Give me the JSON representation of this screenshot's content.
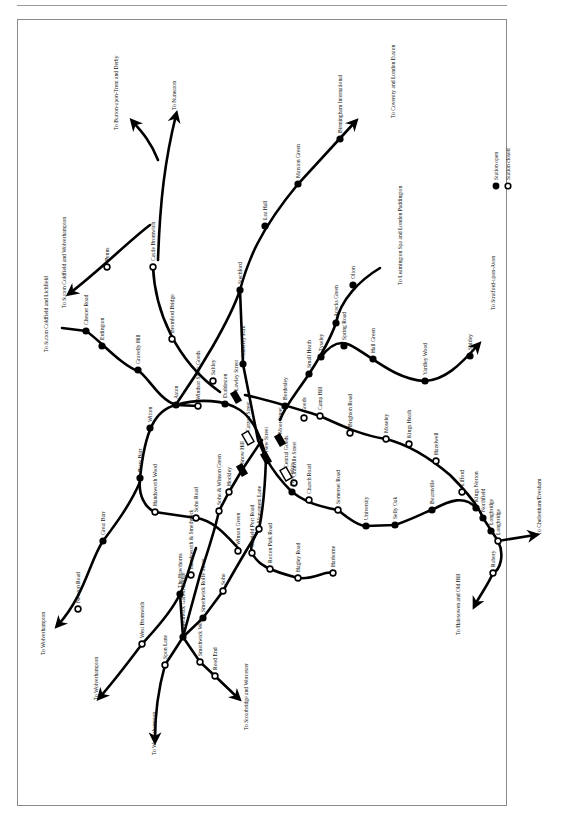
{
  "header": {
    "running_title": ""
  },
  "map": {
    "title": "Birmingham railway network",
    "orientation": "rotated 90° counter-clockwise",
    "legend": {
      "items": [
        {
          "label": "Station open",
          "symbol": "filled-circle"
        },
        {
          "label": "Station closed",
          "symbol": "open-circle"
        }
      ]
    },
    "destinations": [
      {
        "label": "To Nuneaton",
        "x": 176,
        "y": 110
      },
      {
        "label": "To Burton-upon-Trent and Derby",
        "x": 118,
        "y": 130
      },
      {
        "label": "To Sutton Coldfield and Wolverhampton",
        "x": 66,
        "y": 308
      },
      {
        "label": "To Sutton Coldfield and Lichfield",
        "x": 48,
        "y": 352
      },
      {
        "label": "To Coventry and London Euston",
        "x": 395,
        "y": 118
      },
      {
        "label": "To Leamington Spa and London Paddington",
        "x": 402,
        "y": 285
      },
      {
        "label": "To Stratford-upon-Avon",
        "x": 495,
        "y": 310
      },
      {
        "label": "To Cheltenham/Evesham",
        "x": 541,
        "y": 535
      },
      {
        "label": "To Halesowen and Old Hill",
        "x": 460,
        "y": 635
      },
      {
        "label": "To Wolverhampton",
        "x": 45,
        "y": 655
      },
      {
        "label": "To Wolverhampton",
        "x": 98,
        "y": 700
      },
      {
        "label": "To Wolverhampton",
        "x": 156,
        "y": 755
      },
      {
        "label": "To Stourbridge and Worcester",
        "x": 248,
        "y": 730
      }
    ],
    "stations": [
      {
        "name": "Penns",
        "status": "closed",
        "x": 107,
        "y": 267
      },
      {
        "name": "Castle Bromwich",
        "status": "closed",
        "x": 153,
        "y": 267
      },
      {
        "name": "Bromford Bridge",
        "status": "closed",
        "x": 172,
        "y": 339
      },
      {
        "name": "Saltley",
        "status": "closed",
        "x": 213,
        "y": 381
      },
      {
        "name": "Chester Road",
        "status": "open",
        "x": 86,
        "y": 331
      },
      {
        "name": "Erdington",
        "status": "open",
        "x": 102,
        "y": 346
      },
      {
        "name": "Gravelly Hill",
        "status": "open",
        "x": 138,
        "y": 370
      },
      {
        "name": "Aston",
        "status": "open",
        "x": 176,
        "y": 405
      },
      {
        "name": "Witton",
        "status": "open",
        "x": 150,
        "y": 428
      },
      {
        "name": "Windsor Street Goods",
        "status": "closed",
        "x": 198,
        "y": 406
      },
      {
        "name": "Duddeston",
        "status": "open",
        "x": 225,
        "y": 404
      },
      {
        "name": "Lawley Street",
        "status": "goods",
        "x": 236,
        "y": 397
      },
      {
        "name": "Stechford",
        "status": "open",
        "x": 240,
        "y": 290
      },
      {
        "name": "Lea Hall",
        "status": "open",
        "x": 265,
        "y": 226
      },
      {
        "name": "Marston Green",
        "status": "open",
        "x": 298,
        "y": 184
      },
      {
        "name": "Birmingham International",
        "status": "open",
        "x": 340,
        "y": 139
      },
      {
        "name": "Adderley Park",
        "status": "open",
        "x": 243,
        "y": 364
      },
      {
        "name": "Bordesley",
        "status": "open",
        "x": 285,
        "y": 406
      },
      {
        "name": "Small Heath",
        "status": "open",
        "x": 309,
        "y": 374
      },
      {
        "name": "Tyseley",
        "status": "open",
        "x": 321,
        "y": 357
      },
      {
        "name": "Acocks Green",
        "status": "open",
        "x": 336,
        "y": 323
      },
      {
        "name": "Olton",
        "status": "open",
        "x": 353,
        "y": 285
      },
      {
        "name": "Spring Road",
        "status": "open",
        "x": 344,
        "y": 346
      },
      {
        "name": "Hall Green",
        "status": "open",
        "x": 373,
        "y": 359
      },
      {
        "name": "Yardley Wood",
        "status": "open",
        "x": 425,
        "y": 381
      },
      {
        "name": "Shirley",
        "status": "open",
        "x": 470,
        "y": 356
      },
      {
        "name": "Moor Street",
        "status": "goods",
        "x": 280,
        "y": 440
      },
      {
        "name": "Goods",
        "status": "closed",
        "x": 304,
        "y": 418
      },
      {
        "name": "Camp Hill",
        "status": "closed",
        "x": 320,
        "y": 416
      },
      {
        "name": "Brighton Road",
        "status": "closed",
        "x": 350,
        "y": 433
      },
      {
        "name": "Moseley",
        "status": "closed",
        "x": 386,
        "y": 439
      },
      {
        "name": "Kings Heath",
        "status": "closed",
        "x": 409,
        "y": 444
      },
      {
        "name": "Hazelwell",
        "status": "closed",
        "x": 436,
        "y": 461
      },
      {
        "name": "Lifford",
        "status": "closed",
        "x": 462,
        "y": 492
      },
      {
        "name": "Carzon Street",
        "status": "goods-closed",
        "x": 248,
        "y": 438
      },
      {
        "name": "Snow Hill",
        "status": "goods",
        "x": 242,
        "y": 470
      },
      {
        "name": "New Street",
        "status": "goods",
        "x": 266,
        "y": 458
      },
      {
        "name": "Central Goods",
        "status": "goods-closed",
        "x": 286,
        "y": 474
      },
      {
        "name": "Granville Street",
        "status": "closed",
        "x": 294,
        "y": 483
      },
      {
        "name": "Five Ways",
        "status": "open",
        "x": 292,
        "y": 492
      },
      {
        "name": "Church Road",
        "status": "closed",
        "x": 309,
        "y": 500
      },
      {
        "name": "Somerset Road",
        "status": "closed",
        "x": 338,
        "y": 510
      },
      {
        "name": "University",
        "status": "open",
        "x": 366,
        "y": 526
      },
      {
        "name": "Selly Oak",
        "status": "open",
        "x": 395,
        "y": 525
      },
      {
        "name": "Bournville",
        "status": "open",
        "x": 432,
        "y": 510
      },
      {
        "name": "Kings Norton",
        "status": "open",
        "x": 476,
        "y": 508
      },
      {
        "name": "Northfield",
        "status": "open",
        "x": 483,
        "y": 518
      },
      {
        "name": "Longbridge",
        "status": "open",
        "x": 491,
        "y": 531
      },
      {
        "name": "Longbridge",
        "status": "closed",
        "x": 498,
        "y": 541
      },
      {
        "name": "Rubery",
        "status": "closed",
        "x": 493,
        "y": 573
      },
      {
        "name": "Hockley",
        "status": "closed",
        "x": 229,
        "y": 492
      },
      {
        "name": "Soho & Winson Green",
        "status": "closed",
        "x": 219,
        "y": 511
      },
      {
        "name": "Soho Road",
        "status": "closed",
        "x": 196,
        "y": 518
      },
      {
        "name": "Perry Barr",
        "status": "open",
        "x": 140,
        "y": 478
      },
      {
        "name": "Handsworth Wood",
        "status": "closed",
        "x": 155,
        "y": 512
      },
      {
        "name": "Great Barr",
        "status": "open",
        "x": 103,
        "y": 541
      },
      {
        "name": "Newton Road",
        "status": "closed",
        "x": 78,
        "y": 609
      },
      {
        "name": "Monument Lane",
        "status": "closed",
        "x": 259,
        "y": 529
      },
      {
        "name": "Winson Green",
        "status": "closed",
        "x": 238,
        "y": 551
      },
      {
        "name": "Icknield Port Road",
        "status": "closed",
        "x": 252,
        "y": 553
      },
      {
        "name": "Rotton Park Road",
        "status": "closed",
        "x": 270,
        "y": 569
      },
      {
        "name": "Hagley Road",
        "status": "closed",
        "x": 298,
        "y": 578
      },
      {
        "name": "Harborne",
        "status": "closed",
        "x": 333,
        "y": 573
      },
      {
        "name": "Handsworth & Smethwick",
        "status": "closed",
        "x": 191,
        "y": 575
      },
      {
        "name": "The Hawthorns",
        "status": "open",
        "x": 180,
        "y": 594
      },
      {
        "name": "Soho",
        "status": "closed",
        "x": 223,
        "y": 591
      },
      {
        "name": "Smethwick Rolfe Street",
        "status": "open",
        "x": 203,
        "y": 618
      },
      {
        "name": "West Bromwich",
        "status": "closed",
        "x": 142,
        "y": 644
      },
      {
        "name": "Smethwick Galton Bridge",
        "status": "open",
        "x": 183,
        "y": 637
      },
      {
        "name": "Spon Lane",
        "status": "closed",
        "x": 165,
        "y": 665
      },
      {
        "name": "Smethwick West",
        "status": "closed",
        "x": 200,
        "y": 662
      },
      {
        "name": "Rood End",
        "status": "closed",
        "x": 215,
        "y": 676
      }
    ]
  }
}
